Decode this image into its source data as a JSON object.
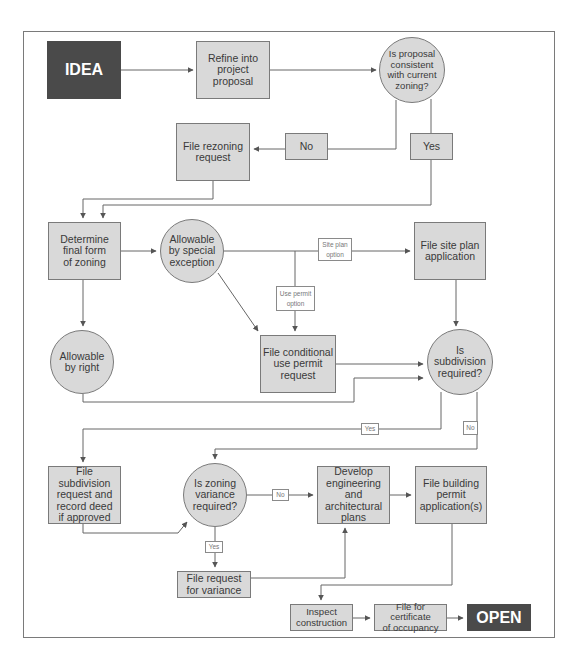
{
  "diagram": {
    "frame": {
      "border_color": "#7a7a7a"
    },
    "colors": {
      "node_fill": "#d9d9d9",
      "terminal_fill": "#4a4a4a",
      "line": "#666666"
    },
    "nodes": {
      "idea": "IDEA",
      "refine": "Refine into\nproject\nproposal",
      "consistent": "Is proposal\nconsistent\nwith current\nzoning?",
      "no_1": "No",
      "yes_1": "Yes",
      "rezoning": "File rezoning\nrequest",
      "determine": "Determine\nfinal form\nof zoning",
      "special_exception": "Allowable\nby special\nexception",
      "site_plan_option": "Site plan\noption",
      "use_permit_option": "Use permit\noption",
      "site_plan": "File site plan\napplication",
      "by_right": "Allowable\nby right",
      "conditional_use": "File conditional\nuse permit\nrequest",
      "subdivision_required": "Is\nsubdivision\nrequired?",
      "yes_2": "Yes",
      "no_2": "No",
      "subdivision_request": "File subdivision\nrequest and\nrecord deed\nif approved",
      "variance_required": "Is zoning\nvariance\nrequired?",
      "no_3": "No",
      "yes_3": "Yes",
      "develop_plans": "Develop\nengineering and\narchitectural\nplans",
      "building_permit": "File building\npermit\napplication(s)",
      "variance_request": "File request\nfor variance",
      "inspect": "Inspect\nconstruction",
      "certificate": "File for certificate\nof occupancy",
      "open": "OPEN"
    }
  }
}
